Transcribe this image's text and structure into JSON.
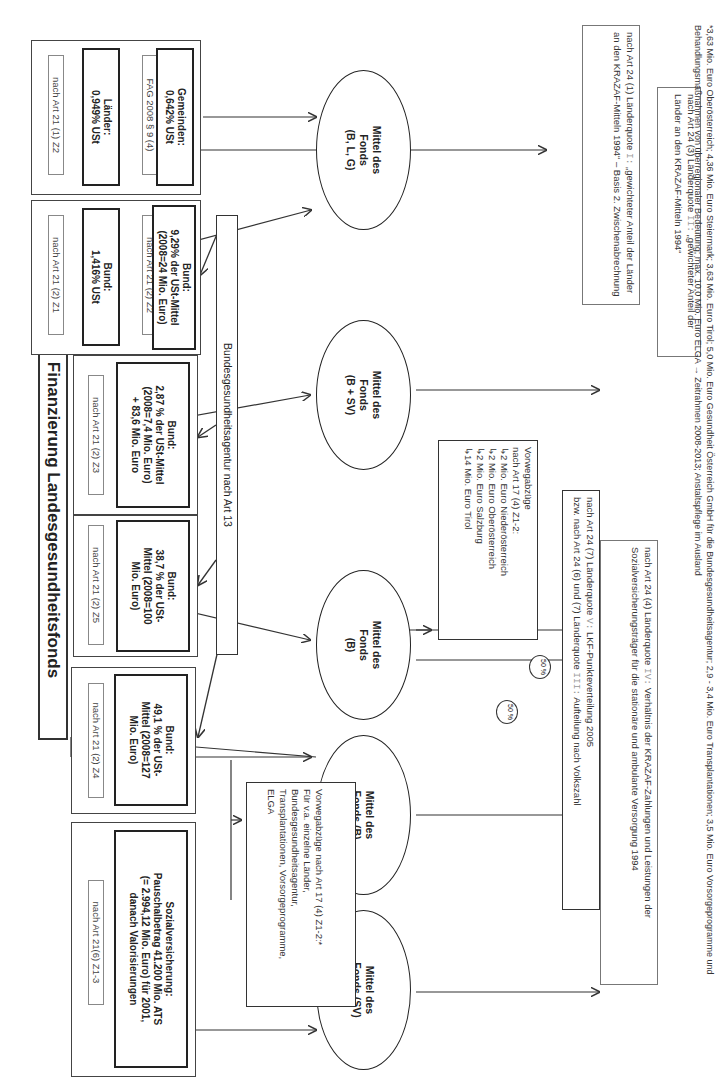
{
  "title": "Finanzierung Landesgesundheitsfonds",
  "agency": "Bundesgesundheitsagentur nach Art 13",
  "sources": [
    {
      "ref": "nach Art 21 (1) Z2",
      "label": "Länder:\n0,949% USt"
    },
    {
      "ref": "FAG 2008 § 9 (4)",
      "label": "Gemeinden:\n0,642% USt"
    },
    {
      "ref": "nach Art 21 (2) Z1",
      "label": "Bund:\n1,416% USt"
    },
    {
      "ref": "nach Art 21 (2) Z2",
      "label": "Bund:\n9,29% der USt-Mittel\n(2008=24 Mio. Euro)"
    },
    {
      "ref": "nach Art 21 (2) Z3",
      "label": "Bund:\n2,87 % der USt-Mittel\n(2008=7,4 Mio. Euro)\n+ 83,6 Mio. Euro"
    },
    {
      "ref": "nach Art 21 (2) Z5",
      "label": "Bund:\n38,7 % der USt-\nMittel (2008=100\nMio. Euro)"
    },
    {
      "ref": "nach Art 21 (2) Z4",
      "label": "Bund:\n49,1 % der USt-\nMittel (2008=127\nMio. Euro)"
    },
    {
      "ref": "nach Art 21(6) Z1-3",
      "label": "Sozialversicherung:\nPauschalbetrag 41.200 Mio. ATS\n(= 2.994,12 Mio. Euro) für 2001,\ndanach Valorisierungen"
    }
  ],
  "funds": [
    {
      "label": "Mittel des\nFonds\n(B, L, G)"
    },
    {
      "label": "Mittel des\nFonds\n(B + SV)"
    },
    {
      "label": "Mittel des\nFonds\n(B)"
    },
    {
      "label": "Mittel des\nFonds (B)"
    },
    {
      "label": "Mittel des\nFonds (SV)"
    }
  ],
  "pre_deductions_1": {
    "heading": "Vorwegabzüge\nnach Art 17 (4) Z1-2:",
    "items": [
      "2 Mio. Euro Niederösterreich",
      "2 Mio. Euro Oberösterreich",
      "2 Mio. Euro Salzburg",
      "14 Mio. Euro Tirol"
    ]
  },
  "pre_deductions_2": {
    "text": "Vorwegabzüge nach Art 17 (4) Z1-2:*\nFür v.a. einzelne Länder,\nBundesgesundheitsagentur,\nTransplantationen, Vorsorgeprogramme,\nELGA"
  },
  "split_badges": [
    "50 %",
    "50 %"
  ],
  "quotas": [
    {
      "pre": "nach Art 24 (1) Länderquote ",
      "q": "I:",
      "post": " „gewichteter Anteil der Länder an den KRAZAF-Mitteln 1994“ – Basis 2. Zwischenabrechnung"
    },
    {
      "pre": "nach Art 24 (3) Länderquote ",
      "q": "II:",
      "post": " „gewichteter Anteil der Länder an den KRAZAF-Mitteln 1994“"
    },
    {
      "pre": "nach Art 24 (7) Länderquote ",
      "q": "V:",
      "post": " LKF-Punkteverteilung 2005",
      "pre2": "bzw. nach Art 24 (6) und (7) Länderquote ",
      "q2": "III:",
      "post2": " Aufteilung nach Volkszahl"
    },
    {
      "pre": "nach Art 24 (4) Länderquote ",
      "q": "IV:",
      "post": " Verhältnis der KRAZAF-Zahlungen und Leistungen der Sozialversicherungsträger für die stationäre und ambulante Versorgung 1994"
    }
  ],
  "footnote": "*3,63 Mio. Euro Oberösterreich; 4,36 Mio. Euro Steiermark; 3,63 Mio. Euro Tirol; 5,0 Mio. Euro Gesundheit Österreich GmbH für die Bundesgesundheitsagentur; 2,9 - 3,4 Mio. Euro Transplantationen; 3,5 Mio. Euro Vorsorgeprogramme und Behandlungsmaßnahmen von überregionaler Bedeutung; max. 10,0 Mio. Euro ELGA → Zeitrahmen 2008-2013; Anstaltspflege im Ausland"
}
